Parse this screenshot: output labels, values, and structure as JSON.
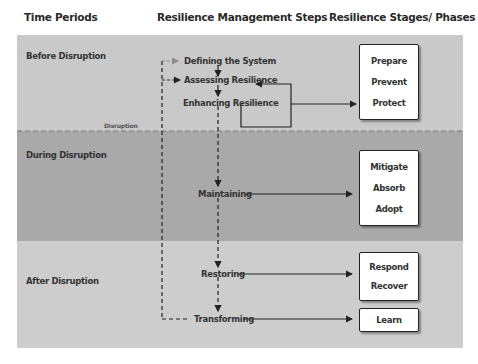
{
  "headers": {
    "time_periods": "Time Periods",
    "steps": "Resilience Management Steps",
    "phases": "Resilience Stages/ Phases"
  },
  "periods": {
    "before": "Before Disruption",
    "during": "During Disruption",
    "after": "After Disruption"
  },
  "disruption_label": "Disruption",
  "steps": {
    "defining": "Defining the System",
    "assessing": "Assessing Resilience",
    "enhancing": "Enhancing Resilience",
    "maintaining": "Maintaining",
    "restoring": "Restoring",
    "transforming": "Transforming"
  },
  "phase_boxes": {
    "before": [
      "Prepare",
      "Prevent",
      "Protect"
    ],
    "during": [
      "Mitigate",
      "Absorb",
      "Adopt"
    ],
    "after_restore": [
      "Respond",
      "Recover"
    ],
    "after_transform": [
      "Learn"
    ]
  },
  "colors": {
    "band_before": "#c9c9c9",
    "band_during": "#a9a9a9",
    "band_after": "#cdcdcd",
    "line": "#222222"
  }
}
